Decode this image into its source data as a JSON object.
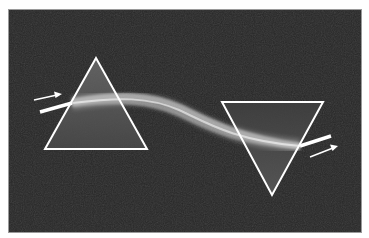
{
  "figure": {
    "colors": {
      "background": "#262626",
      "outline": "#ffffff",
      "beam": "#e6e6e6",
      "prism_fill": "#5a5a5a"
    },
    "prism_left": {
      "points": "87,48 36,139 138,139"
    },
    "prism_right": {
      "points": "213,92 314,92 263,185"
    },
    "beam_in": {
      "x1": 31,
      "y1": 102,
      "x2": 63,
      "y2": 93
    },
    "arrow_in": {
      "x1": 25,
      "y1": 90,
      "x2": 52,
      "y2": 84
    },
    "beam_out": {
      "x1": 291,
      "y1": 136,
      "x2": 322,
      "y2": 126
    },
    "arrow_out": {
      "x1": 301,
      "y1": 147,
      "x2": 328,
      "y2": 136
    }
  }
}
